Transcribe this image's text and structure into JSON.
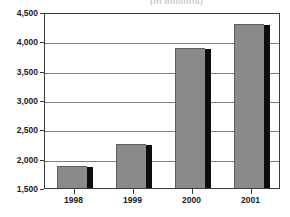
{
  "chart_data": {
    "type": "bar",
    "title": "",
    "title_clipped_text": "(in millions)",
    "xlabel": "",
    "ylabel": "",
    "categories": [
      "1998",
      "1999",
      "2000",
      "2001"
    ],
    "values": [
      1870,
      2250,
      3890,
      4300
    ],
    "ylim": [
      1500,
      4500
    ],
    "ytick_labels": [
      "4,500",
      "4,000",
      "3,500",
      "3,000",
      "2,500",
      "2,000",
      "1,500"
    ],
    "ytick_values": [
      4500,
      4000,
      3500,
      3000,
      2500,
      2000,
      1500
    ],
    "grid": true,
    "legend": "none",
    "series": [
      {
        "name": "",
        "values": [
          1870,
          2250,
          3890,
          4300
        ]
      }
    ],
    "colors": {
      "bar_fill": "#8a8a8a",
      "bar_shadow": "#0d0d0d",
      "bar_outline": "#5e5e5e",
      "gridline": "#7d7d7d",
      "frame": "#3a3a3a",
      "background": "#ffffff",
      "text": "#1a1a1a"
    }
  }
}
